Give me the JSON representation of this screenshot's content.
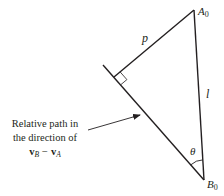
{
  "diagram": {
    "type": "geometric-relative-motion",
    "colors": {
      "stroke": "#231f20",
      "background": "#ffffff"
    },
    "points": {
      "A0": {
        "label": "A",
        "subscript": "0",
        "x": 194,
        "y": 10
      },
      "B0": {
        "label": "B",
        "subscript": "0",
        "x": 204,
        "y": 180
      },
      "foot": {
        "x": 114,
        "y": 77
      },
      "path_start": {
        "x": 103,
        "y": 65
      }
    },
    "segments": [
      {
        "name": "p",
        "from": "A0",
        "to": "foot",
        "label": "p"
      },
      {
        "name": "l",
        "from": "A0",
        "to": "B0",
        "label": "l"
      },
      {
        "name": "relative-path",
        "from": "path_start",
        "to": "B0"
      }
    ],
    "angle": {
      "vertex": "B0",
      "label": "θ"
    },
    "right_angle_at": "foot",
    "annotation": {
      "line1": "Relative path in",
      "line2": "the direction of",
      "vec_b": "v",
      "vec_b_sub": "B",
      "minus": "−",
      "vec_a": "v",
      "vec_a_sub": "A"
    }
  }
}
